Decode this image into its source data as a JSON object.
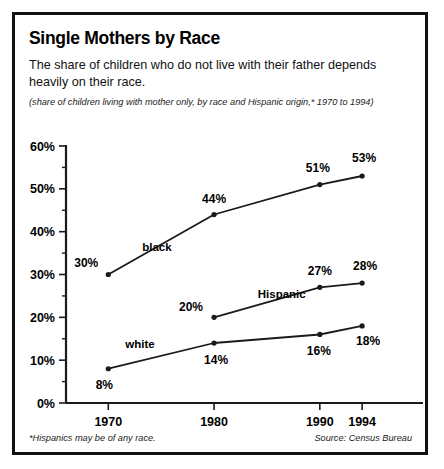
{
  "figure": {
    "title": "Single Mothers by Race",
    "subtitle": "The share of children who do not live with their father depends heavily on their race.",
    "note": "(share of children living with mother only, by race and Hispanic origin,* 1970 to 1994)",
    "footnote": "*Hispanics may be of any race.",
    "source": "Source: Census Bureau",
    "border_color": "#111111",
    "background": "#ffffff",
    "line_color": "#1a1a1a"
  },
  "chart_data": {
    "type": "line",
    "title": "Single Mothers by Race",
    "subtitle": "The share of children who do not live with their father depends heavily on their race.",
    "xlabel": "",
    "ylabel": "",
    "x": [
      1970,
      1980,
      1990,
      1994
    ],
    "xtick_labels": [
      "1970",
      "1980",
      "1990",
      "1994"
    ],
    "ytick_labels": [
      "0%",
      "10%",
      "20%",
      "30%",
      "40%",
      "50%",
      "60%"
    ],
    "ytick_values": [
      0,
      10,
      20,
      30,
      40,
      50,
      60
    ],
    "yminor_step": 5,
    "ylim": [
      0,
      60
    ],
    "xlim": [
      1966,
      1999
    ],
    "grid": false,
    "legend": "inline-labels",
    "series": [
      {
        "name": "black",
        "label": "black",
        "x": [
          1970,
          1980,
          1990,
          1994
        ],
        "values": [
          30,
          44,
          51,
          53
        ],
        "value_labels": [
          "30%",
          "44%",
          "51%",
          "53%"
        ]
      },
      {
        "name": "Hispanic",
        "label": "Hispanic",
        "x": [
          1980,
          1990,
          1994
        ],
        "values": [
          20,
          27,
          28
        ],
        "value_labels": [
          "20%",
          "27%",
          "28%"
        ]
      },
      {
        "name": "white",
        "label": "white",
        "x": [
          1970,
          1980,
          1990,
          1994
        ],
        "values": [
          8,
          14,
          16,
          18
        ],
        "value_labels": [
          "8%",
          "14%",
          "16%",
          "18%"
        ]
      }
    ]
  }
}
